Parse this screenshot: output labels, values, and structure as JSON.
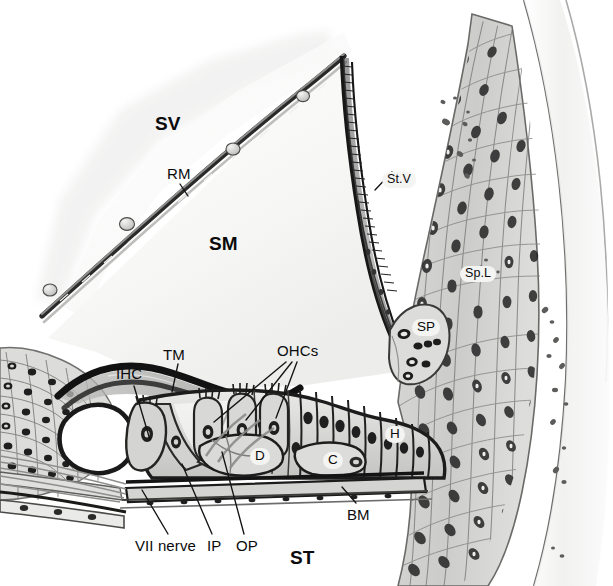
{
  "figure": {
    "background_color": "#ffffff",
    "ink_color": "#1a1a1a",
    "tissue_fill_light": "#e6e6e4",
    "tissue_fill_mid": "#c8c8c6",
    "tissue_fill_dark": "#9b9b99",
    "label_inset_fill": "#f4f4f2"
  },
  "labels": {
    "scala_vestibuli": "SV",
    "reissner_membrane": "RM",
    "scala_media": "SM",
    "stria_vascularis": "St.V",
    "spiral_ligament": "Sp.L",
    "spiral_prominence": "SP",
    "tectorial_membrane": "TM",
    "inner_hair_cell": "IHC",
    "outer_hair_cells": "OHCs",
    "hensen_cells": "H",
    "deiters_cells": "D",
    "claudius_cells": "C",
    "basilar_membrane": "BM",
    "vii_nerve": "VII nerve",
    "inner_pillar": "IP",
    "outer_pillar": "OP",
    "scala_tympani": "ST"
  },
  "label_positions": {
    "scala_vestibuli": {
      "x": 155,
      "y": 114
    },
    "reissner_membrane": {
      "x": 167,
      "y": 166
    },
    "scala_media": {
      "x": 209,
      "y": 234
    },
    "stria_vascularis": {
      "x": 382,
      "y": 172
    },
    "spiral_ligament": {
      "x": 460,
      "y": 266
    },
    "spiral_prominence": {
      "x": 412,
      "y": 319
    },
    "tectorial_membrane": {
      "x": 163,
      "y": 347
    },
    "inner_hair_cell": {
      "x": 116,
      "y": 366
    },
    "outer_hair_cells": {
      "x": 277,
      "y": 343
    },
    "hensen_cells": {
      "x": 385,
      "y": 426
    },
    "deiters_cells": {
      "x": 250,
      "y": 448
    },
    "claudius_cells": {
      "x": 323,
      "y": 452
    },
    "basilar_membrane": {
      "x": 347,
      "y": 507
    },
    "vii_nerve": {
      "x": 135,
      "y": 538
    },
    "inner_pillar": {
      "x": 207,
      "y": 538
    },
    "outer_pillar": {
      "x": 236,
      "y": 538
    },
    "scala_tympani": {
      "x": 290,
      "y": 548
    }
  }
}
